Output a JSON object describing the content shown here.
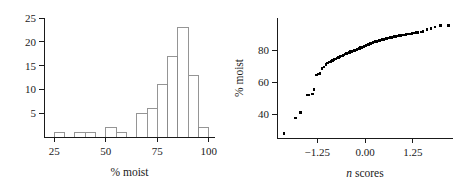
{
  "chart_data": [
    {
      "type": "bar",
      "name": "moisture-histogram",
      "title": "",
      "xlabel": "% moist",
      "ylabel": "",
      "xlim": [
        20,
        103
      ],
      "ylim": [
        0,
        25
      ],
      "xticks": [
        25,
        50,
        75,
        100
      ],
      "xtick_labels": [
        "25",
        "50",
        "75",
        "100"
      ],
      "yticks": [
        5,
        10,
        15,
        20,
        25
      ],
      "ytick_labels": [
        "5",
        "10",
        "15",
        "20",
        "25"
      ],
      "grid": false,
      "legend": "none",
      "bin_width": 5,
      "bins": [
        {
          "left": 25,
          "right": 30,
          "count": 1
        },
        {
          "left": 35,
          "right": 40,
          "count": 1
        },
        {
          "left": 40,
          "right": 45,
          "count": 1
        },
        {
          "left": 50,
          "right": 55,
          "count": 2
        },
        {
          "left": 55,
          "right": 60,
          "count": 1
        },
        {
          "left": 65,
          "right": 70,
          "count": 5
        },
        {
          "left": 70,
          "right": 75,
          "count": 6
        },
        {
          "left": 75,
          "right": 80,
          "count": 11
        },
        {
          "left": 80,
          "right": 85,
          "count": 17
        },
        {
          "left": 85,
          "right": 90,
          "count": 23
        },
        {
          "left": 90,
          "right": 95,
          "count": 13
        },
        {
          "left": 95,
          "right": 100,
          "count": 2
        }
      ],
      "categories": [
        "25-30",
        "35-40",
        "40-45",
        "50-55",
        "55-60",
        "65-70",
        "70-75",
        "75-80",
        "80-85",
        "85-90",
        "90-95",
        "95-100"
      ],
      "values": [
        1,
        1,
        1,
        2,
        1,
        5,
        6,
        11,
        17,
        23,
        13,
        2
      ]
    },
    {
      "type": "scatter",
      "name": "normal-probability-plot",
      "title": "",
      "xlabel_parts": {
        "italic": "n",
        "rest": " scores"
      },
      "xlabel": "n scores",
      "ylabel": "% moist",
      "xlim": [
        -2.3,
        2.3
      ],
      "ylim": [
        25,
        100
      ],
      "xticks": [
        -1.25,
        0.0,
        1.25
      ],
      "xtick_labels": [
        "−1.25",
        "0.00",
        "1.25"
      ],
      "yticks": [
        40,
        60,
        80
      ],
      "ytick_labels": [
        "40",
        "60",
        "80"
      ],
      "grid": false,
      "legend": "none",
      "marker": "square",
      "marker_color": "#000000",
      "points": [
        [
          -2.12,
          28.0
        ],
        [
          -1.82,
          37.5
        ],
        [
          -1.68,
          41.0
        ],
        [
          -1.52,
          52.0
        ],
        [
          -1.46,
          52.0
        ],
        [
          -1.38,
          52.5
        ],
        [
          -1.33,
          55.5
        ],
        [
          -1.27,
          64.5
        ],
        [
          -1.23,
          65.0
        ],
        [
          -1.18,
          65.2
        ],
        [
          -1.12,
          68.5
        ],
        [
          -1.07,
          69.5
        ],
        [
          -1.02,
          71.0
        ],
        [
          -0.98,
          72.0
        ],
        [
          -0.93,
          72.5
        ],
        [
          -0.89,
          73.0
        ],
        [
          -0.85,
          73.5
        ],
        [
          -0.81,
          74.0
        ],
        [
          -0.77,
          74.5
        ],
        [
          -0.73,
          75.0
        ],
        [
          -0.69,
          75.4
        ],
        [
          -0.65,
          75.8
        ],
        [
          -0.62,
          76.2
        ],
        [
          -0.58,
          76.6
        ],
        [
          -0.55,
          77.0
        ],
        [
          -0.51,
          77.4
        ],
        [
          -0.48,
          77.8
        ],
        [
          -0.44,
          78.2
        ],
        [
          -0.41,
          78.5
        ],
        [
          -0.38,
          78.9
        ],
        [
          -0.34,
          79.2
        ],
        [
          -0.31,
          79.5
        ],
        [
          -0.28,
          79.8
        ],
        [
          -0.25,
          80.1
        ],
        [
          -0.21,
          80.4
        ],
        [
          -0.18,
          80.7
        ],
        [
          -0.15,
          81.0
        ],
        [
          -0.12,
          81.4
        ],
        [
          -0.09,
          81.7
        ],
        [
          -0.06,
          82.0
        ],
        [
          -0.03,
          82.3
        ],
        [
          0.0,
          82.6
        ],
        [
          0.03,
          82.9
        ],
        [
          0.06,
          83.2
        ],
        [
          0.09,
          83.5
        ],
        [
          0.12,
          83.8
        ],
        [
          0.15,
          84.1
        ],
        [
          0.18,
          84.4
        ],
        [
          0.21,
          84.6
        ],
        [
          0.25,
          84.9
        ],
        [
          0.28,
          85.2
        ],
        [
          0.31,
          85.4
        ],
        [
          0.34,
          85.7
        ],
        [
          0.38,
          86.0
        ],
        [
          0.41,
          86.2
        ],
        [
          0.44,
          86.4
        ],
        [
          0.48,
          86.7
        ],
        [
          0.51,
          86.9
        ],
        [
          0.55,
          87.1
        ],
        [
          0.58,
          87.3
        ],
        [
          0.62,
          87.5
        ],
        [
          0.65,
          87.7
        ],
        [
          0.69,
          87.9
        ],
        [
          0.73,
          88.1
        ],
        [
          0.77,
          88.3
        ],
        [
          0.81,
          88.5
        ],
        [
          0.85,
          88.7
        ],
        [
          0.89,
          88.9
        ],
        [
          0.93,
          89.1
        ],
        [
          0.98,
          89.3
        ],
        [
          1.02,
          89.5
        ],
        [
          1.07,
          89.7
        ],
        [
          1.12,
          89.9
        ],
        [
          1.18,
          90.1
        ],
        [
          1.23,
          90.3
        ],
        [
          1.27,
          90.6
        ],
        [
          1.33,
          90.8
        ],
        [
          1.38,
          91.0
        ],
        [
          1.46,
          91.2
        ],
        [
          1.52,
          91.4
        ],
        [
          1.62,
          93.0
        ],
        [
          1.72,
          93.5
        ],
        [
          1.83,
          94.5
        ],
        [
          1.98,
          95.5
        ],
        [
          2.18,
          95.5
        ]
      ]
    }
  ]
}
